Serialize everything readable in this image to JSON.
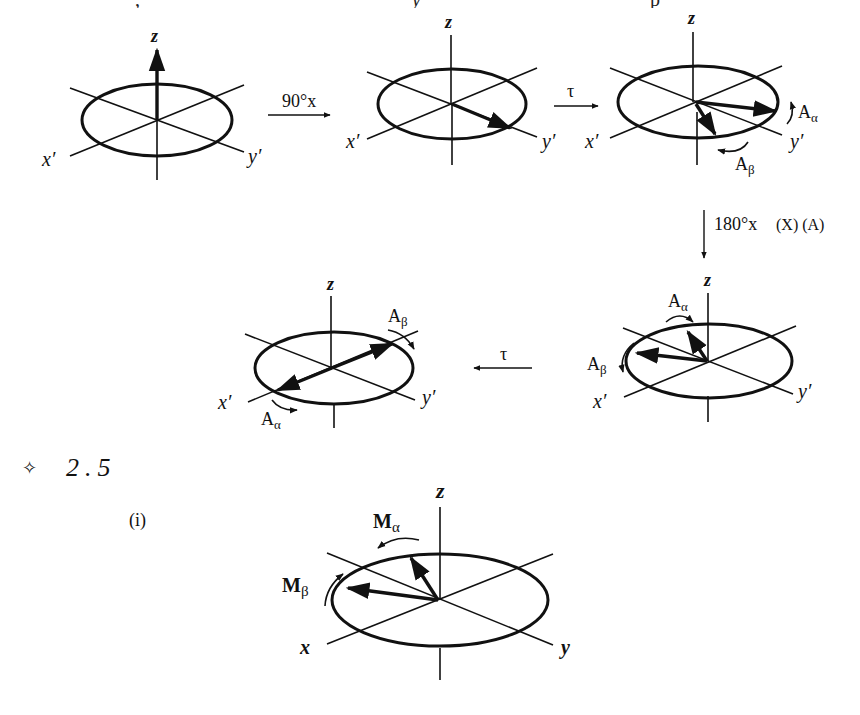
{
  "page": {
    "cropped_top_text": [
      ",",
      "y",
      "p"
    ]
  },
  "figure_a": {
    "panels": [
      {
        "id": "p1",
        "z": "z",
        "x": "x′",
        "y": "y′"
      },
      {
        "id": "p2",
        "z": "z",
        "x": "x′",
        "y": "y′"
      },
      {
        "id": "p3",
        "z": "z",
        "x": "x′",
        "y": "y′",
        "vec1": "A",
        "vec1_sub": "α",
        "vec2": "A",
        "vec2_sub": "β"
      },
      {
        "id": "p4",
        "z": "z",
        "x": "x′",
        "y": "y′",
        "vec1": "A",
        "vec1_sub": "α",
        "vec2": "A",
        "vec2_sub": "β"
      },
      {
        "id": "p5",
        "z": "z",
        "x": "x′",
        "y": "y′",
        "vec1": "A",
        "vec1_sub": "β",
        "vec2": "A",
        "vec2_sub": "α"
      }
    ],
    "transitions": {
      "t1": "90°x",
      "t2": "τ",
      "t3": "180°x",
      "t3_note": "(X) (A)",
      "t4": "τ"
    }
  },
  "section": {
    "marker": "✧",
    "number": "2.5",
    "part": "(i)"
  },
  "figure_b": {
    "z": "z",
    "x": "x",
    "y": "y",
    "vec1": "M",
    "vec1_sub": "α",
    "vec2": "M",
    "vec2_sub": "β"
  }
}
